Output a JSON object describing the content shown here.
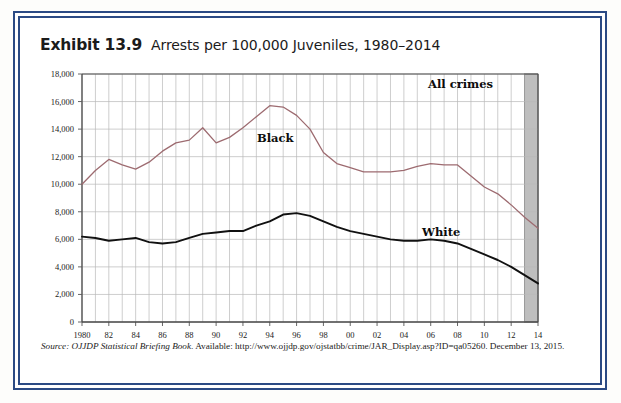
{
  "exhibit": {
    "number": "Exhibit 13.9",
    "title": "Arrests per 100,000 Juveniles, 1980–2014"
  },
  "source": {
    "label": "Source:",
    "publication": "OJJDP Statistical Briefing Book",
    "available_label": ". Available: ",
    "url": "http://www.ojjdp.gov/ojstatbb/crime/JAR_Display.asp?ID=qa05260.",
    "date": "December 13, 2015."
  },
  "colors": {
    "frame": "#2b4a84",
    "black_series": "#9d6b70",
    "white_series": "#111111",
    "grid": "#b9b9b9",
    "axis": "#555555",
    "shaded_band": "#b3b3b3",
    "page": "#ffffff"
  },
  "annotations": {
    "all_crimes": "All crimes",
    "black": "Black",
    "white": "White"
  },
  "chart_data": {
    "type": "line",
    "title": "Arrests per 100,000 Juveniles, 1980–2014",
    "xlabel": "",
    "ylabel": "",
    "xlim": [
      1980,
      2014
    ],
    "ylim": [
      0,
      18000
    ],
    "ytick_step": 2000,
    "grid": true,
    "legend": "inline-labels",
    "shaded_region": [
      2013,
      2014
    ],
    "ytick_labels": [
      "0",
      "2,000",
      "4,000",
      "6,000",
      "8,000",
      "10,000",
      "12,000",
      "14,000",
      "16,000",
      "18,000"
    ],
    "ytick_values": [
      0,
      2000,
      4000,
      6000,
      8000,
      10000,
      12000,
      14000,
      16000,
      18000
    ],
    "x": [
      1980,
      1981,
      1982,
      1983,
      1984,
      1985,
      1986,
      1987,
      1988,
      1989,
      1990,
      1991,
      1992,
      1993,
      1994,
      1995,
      1996,
      1997,
      1998,
      1999,
      2000,
      2001,
      2002,
      2003,
      2004,
      2005,
      2006,
      2007,
      2008,
      2009,
      2010,
      2011,
      2012,
      2013,
      2014
    ],
    "xtick_labels": [
      "1980",
      "82",
      "84",
      "86",
      "88",
      "90",
      "92",
      "94",
      "96",
      "98",
      "00",
      "02",
      "04",
      "06",
      "08",
      "10",
      "12",
      "14"
    ],
    "xtick_values": [
      1980,
      1982,
      1984,
      1986,
      1988,
      1990,
      1992,
      1994,
      1996,
      1998,
      2000,
      2002,
      2004,
      2006,
      2008,
      2010,
      2012,
      2014
    ],
    "series": [
      {
        "name": "Black",
        "color": "#9d6b70",
        "values": [
          10000,
          11000,
          11800,
          11400,
          11100,
          11600,
          12400,
          13000,
          13200,
          14100,
          13000,
          13400,
          14100,
          14900,
          15700,
          15600,
          15000,
          14000,
          12300,
          11500,
          11200,
          10900,
          10900,
          10900,
          11000,
          11300,
          11500,
          11400,
          11400,
          10600,
          9800,
          9300,
          8500,
          7600,
          6800
        ]
      },
      {
        "name": "White",
        "color": "#111111",
        "values": [
          6200,
          6100,
          5900,
          6000,
          6100,
          5800,
          5700,
          5800,
          6100,
          6400,
          6500,
          6600,
          6600,
          7000,
          7300,
          7800,
          7900,
          7700,
          7300,
          6900,
          6600,
          6400,
          6200,
          6000,
          5900,
          5900,
          6000,
          5900,
          5700,
          5300,
          4900,
          4500,
          4000,
          3400,
          2800
        ]
      }
    ]
  }
}
